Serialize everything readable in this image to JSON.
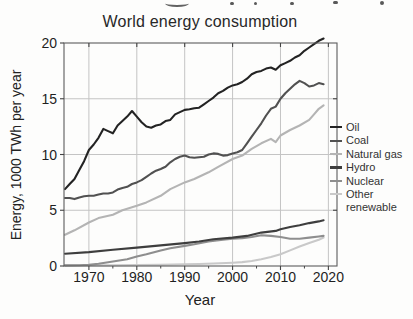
{
  "chart_data": {
    "type": "line",
    "title": "World energy consumption",
    "xlabel": "Year",
    "ylabel": "Energy, 1000 TWh per year",
    "xlim": [
      1964.8,
      2021.8
    ],
    "ylim": [
      0,
      20
    ],
    "x_ticks": [
      1970,
      1980,
      1990,
      2000,
      2010,
      2020
    ],
    "y_ticks": [
      0,
      5,
      10,
      15,
      20
    ],
    "grid": true,
    "legend_position": "right",
    "colors": {
      "grid": "#c4c4c4",
      "spine": "#5c5c5c",
      "tick": "#444444",
      "tick_label": "#1f1f1f"
    },
    "series": [
      {
        "name": "Oil",
        "color": "#232323",
        "points": [
          [
            1965,
            6.9
          ],
          [
            1966,
            7.35
          ],
          [
            1967,
            7.8
          ],
          [
            1968,
            8.6
          ],
          [
            1969,
            9.4
          ],
          [
            1970,
            10.4
          ],
          [
            1971,
            10.9
          ],
          [
            1972,
            11.5
          ],
          [
            1973,
            12.3
          ],
          [
            1974,
            12.1
          ],
          [
            1975,
            11.9
          ],
          [
            1976,
            12.6
          ],
          [
            1977,
            13.0
          ],
          [
            1978,
            13.4
          ],
          [
            1979,
            13.9
          ],
          [
            1980,
            13.4
          ],
          [
            1981,
            12.9
          ],
          [
            1982,
            12.5
          ],
          [
            1983,
            12.4
          ],
          [
            1984,
            12.6
          ],
          [
            1985,
            12.7
          ],
          [
            1986,
            13.0
          ],
          [
            1987,
            13.1
          ],
          [
            1988,
            13.6
          ],
          [
            1989,
            13.8
          ],
          [
            1990,
            14.0
          ],
          [
            1991,
            14.05
          ],
          [
            1992,
            14.15
          ],
          [
            1993,
            14.2
          ],
          [
            1994,
            14.5
          ],
          [
            1995,
            14.8
          ],
          [
            1996,
            15.1
          ],
          [
            1997,
            15.5
          ],
          [
            1998,
            15.7
          ],
          [
            1999,
            16.0
          ],
          [
            2000,
            16.2
          ],
          [
            2001,
            16.3
          ],
          [
            2002,
            16.5
          ],
          [
            2003,
            16.8
          ],
          [
            2004,
            17.2
          ],
          [
            2005,
            17.4
          ],
          [
            2006,
            17.5
          ],
          [
            2007,
            17.7
          ],
          [
            2008,
            17.8
          ],
          [
            2009,
            17.6
          ],
          [
            2010,
            18.0
          ],
          [
            2011,
            18.2
          ],
          [
            2012,
            18.4
          ],
          [
            2013,
            18.7
          ],
          [
            2014,
            18.9
          ],
          [
            2015,
            19.3
          ],
          [
            2016,
            19.6
          ],
          [
            2017,
            19.9
          ],
          [
            2018,
            20.2
          ],
          [
            2019,
            20.4
          ]
        ]
      },
      {
        "name": "Coal",
        "color": "#515151",
        "points": [
          [
            1965,
            6.1
          ],
          [
            1966,
            6.1
          ],
          [
            1967,
            6.0
          ],
          [
            1968,
            6.15
          ],
          [
            1969,
            6.25
          ],
          [
            1970,
            6.3
          ],
          [
            1971,
            6.3
          ],
          [
            1972,
            6.4
          ],
          [
            1973,
            6.5
          ],
          [
            1974,
            6.5
          ],
          [
            1975,
            6.6
          ],
          [
            1976,
            6.85
          ],
          [
            1977,
            7.0
          ],
          [
            1978,
            7.1
          ],
          [
            1979,
            7.35
          ],
          [
            1980,
            7.5
          ],
          [
            1981,
            7.7
          ],
          [
            1982,
            8.0
          ],
          [
            1983,
            8.3
          ],
          [
            1984,
            8.55
          ],
          [
            1985,
            8.7
          ],
          [
            1986,
            8.9
          ],
          [
            1987,
            9.3
          ],
          [
            1988,
            9.6
          ],
          [
            1989,
            9.8
          ],
          [
            1990,
            9.9
          ],
          [
            1991,
            9.75
          ],
          [
            1992,
            9.7
          ],
          [
            1993,
            9.75
          ],
          [
            1994,
            9.8
          ],
          [
            1995,
            10.0
          ],
          [
            1996,
            10.1
          ],
          [
            1997,
            10.05
          ],
          [
            1998,
            9.9
          ],
          [
            1999,
            9.95
          ],
          [
            2000,
            10.1
          ],
          [
            2001,
            10.2
          ],
          [
            2002,
            10.4
          ],
          [
            2003,
            11.0
          ],
          [
            2004,
            11.6
          ],
          [
            2005,
            12.2
          ],
          [
            2006,
            12.8
          ],
          [
            2007,
            13.5
          ],
          [
            2008,
            14.1
          ],
          [
            2009,
            14.3
          ],
          [
            2010,
            15.0
          ],
          [
            2011,
            15.5
          ],
          [
            2012,
            15.9
          ],
          [
            2013,
            16.3
          ],
          [
            2014,
            16.6
          ],
          [
            2015,
            16.4
          ],
          [
            2016,
            16.1
          ],
          [
            2017,
            16.2
          ],
          [
            2018,
            16.4
          ],
          [
            2019,
            16.3
          ]
        ]
      },
      {
        "name": "Natural gas",
        "color": "#b4b4b4",
        "points": [
          [
            1965,
            2.8
          ],
          [
            1967,
            3.2
          ],
          [
            1970,
            3.9
          ],
          [
            1972,
            4.3
          ],
          [
            1975,
            4.6
          ],
          [
            1977,
            5.0
          ],
          [
            1980,
            5.4
          ],
          [
            1982,
            5.7
          ],
          [
            1985,
            6.3
          ],
          [
            1987,
            6.9
          ],
          [
            1990,
            7.5
          ],
          [
            1992,
            7.8
          ],
          [
            1995,
            8.4
          ],
          [
            1997,
            8.9
          ],
          [
            2000,
            9.6
          ],
          [
            2002,
            9.9
          ],
          [
            2004,
            10.5
          ],
          [
            2006,
            11.0
          ],
          [
            2008,
            11.4
          ],
          [
            2009,
            11.1
          ],
          [
            2010,
            11.7
          ],
          [
            2012,
            12.2
          ],
          [
            2014,
            12.6
          ],
          [
            2016,
            13.1
          ],
          [
            2017,
            13.6
          ],
          [
            2018,
            14.1
          ],
          [
            2019,
            14.4
          ]
        ]
      },
      {
        "name": "Hydro",
        "color": "#3e3e3e",
        "points": [
          [
            1965,
            1.1
          ],
          [
            1970,
            1.25
          ],
          [
            1975,
            1.45
          ],
          [
            1980,
            1.65
          ],
          [
            1985,
            1.85
          ],
          [
            1990,
            2.05
          ],
          [
            1993,
            2.2
          ],
          [
            1996,
            2.4
          ],
          [
            2000,
            2.55
          ],
          [
            2003,
            2.7
          ],
          [
            2006,
            3.0
          ],
          [
            2009,
            3.15
          ],
          [
            2010,
            3.3
          ],
          [
            2012,
            3.5
          ],
          [
            2014,
            3.65
          ],
          [
            2016,
            3.85
          ],
          [
            2018,
            4.0
          ],
          [
            2019,
            4.1
          ]
        ]
      },
      {
        "name": "Nuclear",
        "color": "#8e8e8e",
        "points": [
          [
            1965,
            0.05
          ],
          [
            1968,
            0.07
          ],
          [
            1970,
            0.1
          ],
          [
            1972,
            0.2
          ],
          [
            1975,
            0.4
          ],
          [
            1978,
            0.6
          ],
          [
            1980,
            0.85
          ],
          [
            1982,
            1.05
          ],
          [
            1985,
            1.4
          ],
          [
            1987,
            1.6
          ],
          [
            1990,
            1.8
          ],
          [
            1992,
            1.95
          ],
          [
            1995,
            2.2
          ],
          [
            1998,
            2.35
          ],
          [
            2000,
            2.45
          ],
          [
            2002,
            2.5
          ],
          [
            2004,
            2.6
          ],
          [
            2006,
            2.75
          ],
          [
            2008,
            2.7
          ],
          [
            2010,
            2.6
          ],
          [
            2012,
            2.45
          ],
          [
            2014,
            2.45
          ],
          [
            2016,
            2.55
          ],
          [
            2018,
            2.65
          ],
          [
            2019,
            2.7
          ]
        ]
      },
      {
        "name": "Other renewable",
        "color": "#c9c9c9",
        "points": [
          [
            1965,
            0.06
          ],
          [
            1970,
            0.06
          ],
          [
            1975,
            0.07
          ],
          [
            1980,
            0.09
          ],
          [
            1985,
            0.1
          ],
          [
            1990,
            0.15
          ],
          [
            1993,
            0.18
          ],
          [
            1996,
            0.22
          ],
          [
            2000,
            0.3
          ],
          [
            2002,
            0.35
          ],
          [
            2004,
            0.45
          ],
          [
            2006,
            0.6
          ],
          [
            2008,
            0.8
          ],
          [
            2010,
            1.05
          ],
          [
            2012,
            1.4
          ],
          [
            2014,
            1.75
          ],
          [
            2016,
            2.05
          ],
          [
            2018,
            2.35
          ],
          [
            2019,
            2.55
          ]
        ]
      }
    ]
  }
}
